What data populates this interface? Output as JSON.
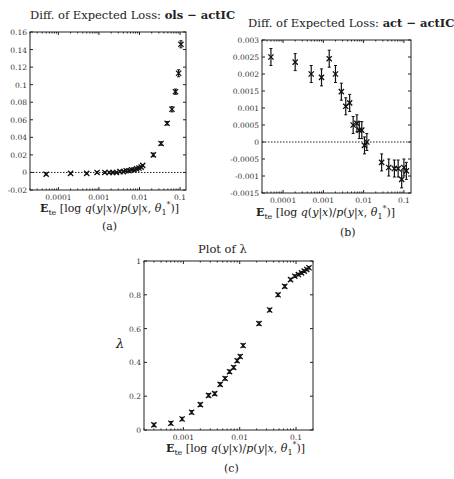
{
  "chart_data": [
    {
      "id": "a",
      "type": "scatter",
      "title_prefix": "Diff. of Expected Loss: ",
      "title_bold": "ols − actIC",
      "xlabel": "E_te [log q(y|x)/p(y|x, θ1*)]",
      "caption": "(a)",
      "xscale": "log",
      "xticks": [
        0.0001,
        0.001,
        0.01,
        0.1
      ],
      "xtick_labels": [
        "0.0001",
        "0.001",
        "0.01",
        "0.1"
      ],
      "yticks": [
        -0.02,
        0,
        0.02,
        0.04,
        0.06,
        0.08,
        0.1,
        0.12,
        0.14,
        0.16
      ],
      "ytick_labels": [
        "-0.02",
        "0",
        "0.02",
        "0.04",
        "0.06",
        "0.08",
        "0.1",
        "0.12",
        "0.14",
        "0.16"
      ],
      "ylim": [
        -0.02,
        0.16
      ],
      "xlim": [
        2e-05,
        0.14
      ],
      "reference_line": 0,
      "grid": false,
      "x": [
        5e-05,
        0.0002,
        0.0005,
        0.0009,
        0.0014,
        0.0018,
        0.0022,
        0.0027,
        0.0033,
        0.004,
        0.0047,
        0.0055,
        0.0064,
        0.0074,
        0.0085,
        0.0097,
        0.011,
        0.012,
        0.022,
        0.034,
        0.048,
        0.063,
        0.077,
        0.092,
        0.105
      ],
      "y": [
        -0.002,
        -0.001,
        -0.001,
        0.0,
        0.0,
        0.0,
        0.0,
        0.0,
        0.001,
        0.001,
        0.002,
        0.002,
        0.003,
        0.003,
        0.004,
        0.005,
        0.006,
        0.008,
        0.02,
        0.033,
        0.056,
        0.072,
        0.092,
        0.113,
        0.146
      ],
      "err": [
        0.001,
        0.001,
        0.001,
        0.001,
        0.001,
        0.001,
        0.001,
        0.001,
        0.001,
        0.001,
        0.001,
        0.001,
        0.001,
        0.001,
        0.001,
        0.001,
        0.001,
        0.001,
        0.002,
        0.002,
        0.002,
        0.003,
        0.003,
        0.004,
        0.004
      ]
    },
    {
      "id": "b",
      "type": "scatter",
      "title_prefix": "Diff. of Expected Loss: ",
      "title_bold": "act − actIC",
      "xlabel": "E_te [log q(y|x)/p(y|x, θ1*)]",
      "caption": "(b)",
      "xscale": "log",
      "xticks": [
        0.0001,
        0.001,
        0.01,
        0.1
      ],
      "xtick_labels": [
        "0.0001",
        "0.001",
        "0.01",
        "0.1"
      ],
      "yticks": [
        -0.0015,
        -0.001,
        -0.0005,
        0,
        0.0005,
        0.001,
        0.0015,
        0.002,
        0.0025,
        0.003
      ],
      "ytick_labels": [
        "-0.0015",
        "-0.001",
        "-0.0005",
        "0",
        "0.0005",
        "0.001",
        "0.0015",
        "0.002",
        "0.0025",
        "0.003"
      ],
      "ylim": [
        -0.0015,
        0.003
      ],
      "xlim": [
        3e-05,
        0.15
      ],
      "reference_line": 0,
      "grid": false,
      "x": [
        5e-05,
        0.0002,
        0.0005,
        0.0009,
        0.0014,
        0.002,
        0.0028,
        0.0036,
        0.0045,
        0.0055,
        0.0068,
        0.0078,
        0.009,
        0.0105,
        0.012,
        0.028,
        0.042,
        0.058,
        0.072,
        0.088,
        0.1,
        0.115
      ],
      "y": [
        0.0025,
        0.00235,
        0.002,
        0.0019,
        0.00245,
        0.002,
        0.00148,
        0.00105,
        0.00115,
        0.0005,
        0.00055,
        0.00035,
        0.00035,
        -0.0001,
        0.0,
        -0.0006,
        -0.00075,
        -0.00078,
        -0.00078,
        -0.0011,
        -0.00075,
        -0.00085
      ],
      "err": [
        0.00025,
        0.00025,
        0.00025,
        0.00025,
        0.00025,
        0.00025,
        0.00025,
        0.00025,
        0.00025,
        0.00025,
        0.00025,
        0.00025,
        0.00025,
        0.00025,
        0.00025,
        0.00025,
        0.00025,
        0.00025,
        0.00025,
        0.00025,
        0.00025,
        0.00025
      ]
    },
    {
      "id": "c",
      "type": "scatter",
      "title": "Plot of λ",
      "ylabel": "λ",
      "xlabel": "E_te [log q(y|x)/p(y|x, θ1*)]",
      "caption": "(c)",
      "xscale": "log",
      "xticks": [
        0.001,
        0.01,
        0.1
      ],
      "xtick_labels": [
        "0.001",
        "0.01",
        "0.1"
      ],
      "yticks": [
        0,
        0.2,
        0.4,
        0.6,
        0.8,
        1
      ],
      "ytick_labels": [
        "0",
        "0.2",
        "0.4",
        "0.6",
        "0.8",
        "1"
      ],
      "ylim": [
        0,
        1
      ],
      "xlim": [
        0.0002,
        0.2
      ],
      "grid": false,
      "x": [
        0.0003,
        0.0006,
        0.00095,
        0.0014,
        0.002,
        0.0028,
        0.0036,
        0.0045,
        0.0055,
        0.0066,
        0.0078,
        0.009,
        0.0102,
        0.0115,
        0.022,
        0.034,
        0.048,
        0.063,
        0.08,
        0.095,
        0.11,
        0.125,
        0.14,
        0.155,
        0.17
      ],
      "y": [
        0.03,
        0.04,
        0.065,
        0.105,
        0.15,
        0.205,
        0.215,
        0.27,
        0.305,
        0.345,
        0.37,
        0.41,
        0.435,
        0.5,
        0.63,
        0.71,
        0.8,
        0.85,
        0.89,
        0.91,
        0.92,
        0.93,
        0.94,
        0.95,
        0.96
      ],
      "err": [
        0.01,
        0.01,
        0.01,
        0.01,
        0.01,
        0.01,
        0.01,
        0.01,
        0.01,
        0.01,
        0.01,
        0.01,
        0.01,
        0.01,
        0.01,
        0.01,
        0.01,
        0.01,
        0.008,
        0.008,
        0.008,
        0.008,
        0.008,
        0.008,
        0.008
      ]
    }
  ]
}
